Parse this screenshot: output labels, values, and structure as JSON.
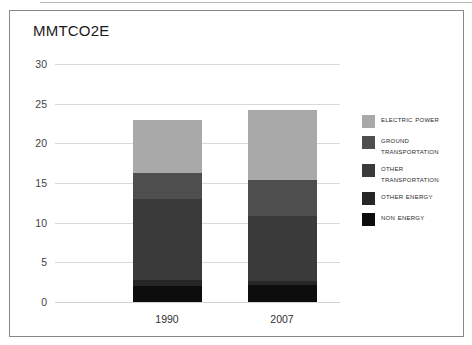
{
  "panel": {
    "title": "MMTCO2E"
  },
  "axes": {
    "y_ticks": [
      "30",
      "25",
      "20",
      "15",
      "10",
      "5",
      "0"
    ],
    "x_ticks": [
      "1990",
      "2007"
    ]
  },
  "legend": {
    "items": [
      {
        "label": "Electric Power",
        "color": "#a9a9a9"
      },
      {
        "label": "Ground Transportation",
        "color": "#4e4e4e"
      },
      {
        "label": "Other Transportation",
        "color": "#3a3a3a"
      },
      {
        "label": "Other Energy",
        "color": "#262626"
      },
      {
        "label": "Non Energy",
        "color": "#0d0d0d"
      }
    ]
  },
  "chart_data": {
    "type": "bar",
    "stacked": true,
    "title": "MMTCO2E",
    "xlabel": "",
    "ylabel": "MMTCO2E",
    "ylim": [
      0,
      30
    ],
    "yticks": [
      0,
      5,
      10,
      15,
      20,
      25,
      30
    ],
    "grid": true,
    "legend_position": "right",
    "categories": [
      "1990",
      "2007"
    ],
    "series": [
      {
        "name": "Non Energy",
        "color": "#0d0d0d",
        "values": [
          2.0,
          2.2
        ]
      },
      {
        "name": "Other Energy",
        "color": "#262626",
        "values": [
          0.8,
          0.5
        ]
      },
      {
        "name": "Other Transportation",
        "color": "#3a3a3a",
        "values": [
          10.2,
          8.2
        ]
      },
      {
        "name": "Ground Transportation",
        "color": "#4e4e4e",
        "values": [
          3.3,
          4.5
        ]
      },
      {
        "name": "Electric Power",
        "color": "#a9a9a9",
        "values": [
          6.7,
          8.8
        ]
      }
    ],
    "totals": [
      23.0,
      24.2
    ]
  }
}
